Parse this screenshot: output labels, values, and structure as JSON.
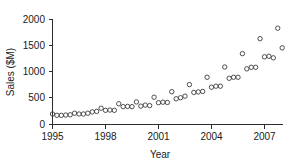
{
  "chart_data": {
    "type": "scatter",
    "title": "",
    "xlabel": "Year",
    "ylabel": "Sales ($M)",
    "xlim": [
      1995,
      2008.5
    ],
    "ylim": [
      0,
      2000
    ],
    "grid": false,
    "legend": null,
    "marker": "open-circle",
    "marker_color": "#3c3c3c",
    "xticks": [
      1995,
      1998,
      2001,
      2004,
      2007
    ],
    "xtick_labels": [
      "1995",
      "1998",
      "2001",
      "2004",
      "2007"
    ],
    "yticks": [
      0,
      500,
      1000,
      1500,
      2000
    ],
    "ytick_labels": [
      "0",
      "500",
      "1000",
      "1500",
      "2000"
    ],
    "x": [
      1995.0,
      1995.25,
      1995.5,
      1995.75,
      1996.0,
      1996.25,
      1996.5,
      1996.75,
      1997.0,
      1997.25,
      1997.5,
      1997.75,
      1998.0,
      1998.25,
      1998.5,
      1998.75,
      1999.0,
      1999.25,
      1999.5,
      1999.75,
      2000.0,
      2000.25,
      2000.5,
      2000.75,
      2001.0,
      2001.25,
      2001.5,
      2001.75,
      2002.0,
      2002.25,
      2002.5,
      2002.75,
      2003.0,
      2003.25,
      2003.5,
      2003.75,
      2004.0,
      2004.25,
      2004.5,
      2004.75,
      2005.0,
      2005.25,
      2005.5,
      2005.75,
      2006.0,
      2006.25,
      2006.5,
      2006.75,
      2007.0,
      2007.25,
      2007.5,
      2007.75,
      2008.0
    ],
    "y": [
      200,
      175,
      175,
      180,
      185,
      215,
      200,
      200,
      215,
      240,
      250,
      310,
      270,
      275,
      270,
      395,
      340,
      345,
      340,
      430,
      350,
      370,
      360,
      520,
      415,
      425,
      420,
      625,
      490,
      510,
      540,
      760,
      610,
      620,
      630,
      900,
      710,
      730,
      730,
      1095,
      880,
      900,
      900,
      1350,
      1060,
      1090,
      1090,
      1635,
      1290,
      1300,
      1270,
      1835,
      1460,
      1490,
      1720
    ],
    "n_points": 55
  },
  "axes": {
    "ylabel": "Sales ($M)",
    "xlabel": "Year"
  }
}
